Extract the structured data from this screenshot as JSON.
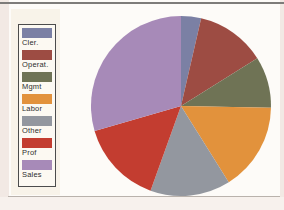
{
  "chart_data": {
    "type": "pie",
    "title": "",
    "categories": [
      "Cler.",
      "Operat.",
      "Mgmt",
      "Labor",
      "Other",
      "Prof",
      "Sales"
    ],
    "values": [
      3.6,
      12.5,
      9.2,
      15.8,
      14.4,
      15.0,
      29.5
    ],
    "value_format": "share_percent_estimated_from_angles",
    "colors": [
      "#7b80a4",
      "#9d4c43",
      "#6f7355",
      "#e2923c",
      "#93979f",
      "#c33d30",
      "#a78ab8"
    ],
    "start_angle_deg": 0,
    "direction": "clockwise",
    "legend_position": "left",
    "grid": "off"
  },
  "legend": {
    "items": [
      {
        "label": "Cler.",
        "color": "#7b80a4"
      },
      {
        "label": "Operat.",
        "color": "#9d4c43"
      },
      {
        "label": "Mgmt",
        "color": "#6f7355"
      },
      {
        "label": "Labor",
        "color": "#e2923c"
      },
      {
        "label": "Other",
        "color": "#93979f"
      },
      {
        "label": "Prof",
        "color": "#c33d30"
      },
      {
        "label": "Sales",
        "color": "#a78ab8"
      }
    ]
  },
  "frame": {
    "top_rule_color": "#7e7c7a",
    "bottom_rule_color": "#b9b2ac",
    "page_margin_color": "#f2e9e4",
    "legend_border_color": "#4c4c4c"
  }
}
